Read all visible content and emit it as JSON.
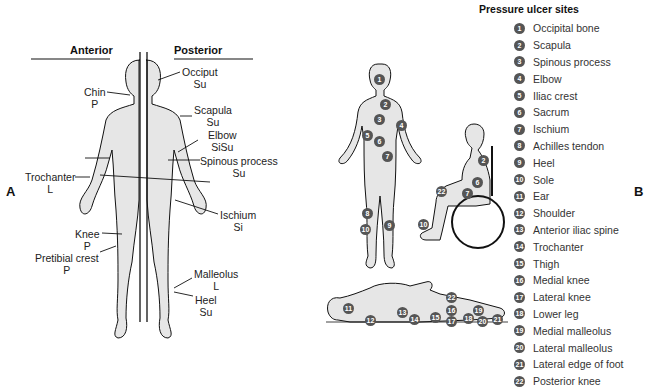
{
  "panel_a": {
    "letter": "A",
    "headers": {
      "anterior": "Anterior",
      "posterior": "Posterior"
    },
    "labels": [
      {
        "id": "occiput",
        "name": "Occiput",
        "code": "Su"
      },
      {
        "id": "chin",
        "name": "Chin",
        "code": "P"
      },
      {
        "id": "scapula",
        "name": "Scapula",
        "code": "Su"
      },
      {
        "id": "elbow",
        "name": "Elbow",
        "code": "SiSu"
      },
      {
        "id": "spinous",
        "name": "Spinous process",
        "code": "Su"
      },
      {
        "id": "trochanter",
        "name": "Trochanter",
        "code": "L"
      },
      {
        "id": "ischium",
        "name": "Ischium",
        "code": "Si"
      },
      {
        "id": "knee",
        "name": "Knee",
        "code": "P"
      },
      {
        "id": "pretibial",
        "name": "Pretibial crest",
        "code": "P"
      },
      {
        "id": "malleolus",
        "name": "Malleolus",
        "code": "L"
      },
      {
        "id": "heel",
        "name": "Heel",
        "code": "Su"
      }
    ]
  },
  "panel_b": {
    "letter": "B",
    "legend_title": "Pressure ulcer sites",
    "sites": [
      {
        "n": "1",
        "label": "Occipital bone"
      },
      {
        "n": "2",
        "label": "Scapula"
      },
      {
        "n": "3",
        "label": "Spinous process"
      },
      {
        "n": "4",
        "label": "Elbow"
      },
      {
        "n": "5",
        "label": "Iliac crest"
      },
      {
        "n": "6",
        "label": "Sacrum"
      },
      {
        "n": "7",
        "label": "Ischium"
      },
      {
        "n": "8",
        "label": "Achilles tendon"
      },
      {
        "n": "9",
        "label": "Heel"
      },
      {
        "n": "10",
        "label": "Sole"
      },
      {
        "n": "11",
        "label": "Ear"
      },
      {
        "n": "12",
        "label": "Shoulder"
      },
      {
        "n": "13",
        "label": "Anterior iliac spine"
      },
      {
        "n": "14",
        "label": "Trochanter"
      },
      {
        "n": "15",
        "label": "Thigh"
      },
      {
        "n": "16",
        "label": "Medial knee"
      },
      {
        "n": "17",
        "label": "Lateral knee"
      },
      {
        "n": "18",
        "label": "Lower leg"
      },
      {
        "n": "19",
        "label": "Medial malleolus"
      },
      {
        "n": "20",
        "label": "Lateral malleolus"
      },
      {
        "n": "21",
        "label": "Lateral edge of foot"
      },
      {
        "n": "22",
        "label": "Posterior knee"
      }
    ],
    "markers": {
      "standing": [
        "1",
        "2",
        "3",
        "4",
        "5",
        "6",
        "7",
        "8",
        "9",
        "10"
      ],
      "seated": [
        "2",
        "6",
        "7",
        "22",
        "10"
      ],
      "lying": [
        "11",
        "12",
        "13",
        "14",
        "15",
        "16",
        "17",
        "18",
        "19",
        "20",
        "21",
        "22"
      ]
    }
  },
  "colors": {
    "marker": "#555555",
    "figure_fill": "#e6e6e6",
    "line": "#111111"
  }
}
